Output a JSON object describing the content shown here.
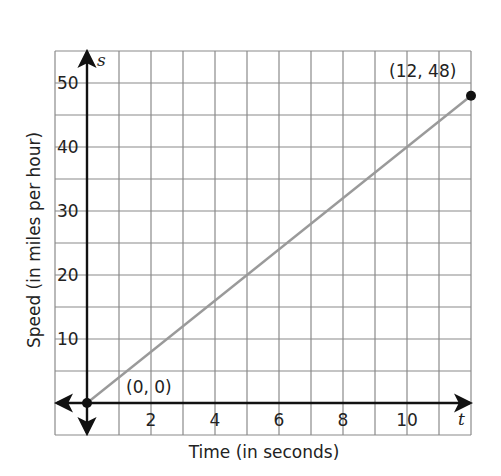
{
  "chart_data": {
    "type": "line",
    "title": "",
    "xlabel": "Time (in seconds)",
    "ylabel": "Speed (in miles per hour)",
    "x_var": "t",
    "y_var": "s",
    "xlim": [
      -1,
      12
    ],
    "ylim": [
      -5,
      55
    ],
    "grid": true,
    "x_gridstep": 1,
    "y_gridstep": 5,
    "x_ticks": [
      2,
      4,
      6,
      8,
      10
    ],
    "x_tick_labels": [
      "2",
      "4",
      "6",
      "8",
      "10"
    ],
    "y_ticks": [
      10,
      20,
      30,
      40,
      50
    ],
    "y_tick_labels": [
      "10",
      "20",
      "30",
      "40",
      "50"
    ],
    "series": [
      {
        "name": "speed",
        "x": [
          0,
          12
        ],
        "y": [
          0,
          48
        ],
        "color": "#9a9a9a"
      }
    ],
    "points": [
      {
        "x": 0,
        "y": 0,
        "label": "(0, 0)"
      },
      {
        "x": 12,
        "y": 48,
        "label": "(12, 48)"
      }
    ],
    "legend": null
  },
  "labels": {
    "xlabel": "Time (in seconds)",
    "ylabel": "Speed (in miles per hour)",
    "x_var": "t",
    "y_var": "s",
    "origin_point": "(0, 0)",
    "end_point": "(12, 48)",
    "xticks": [
      "2",
      "4",
      "6",
      "8",
      "10"
    ],
    "yticks": [
      "10",
      "20",
      "30",
      "40",
      "50"
    ]
  },
  "colors": {
    "grid": "#8a8a8a",
    "axis": "#111111",
    "line": "#9a9a9a",
    "point": "#111111"
  }
}
